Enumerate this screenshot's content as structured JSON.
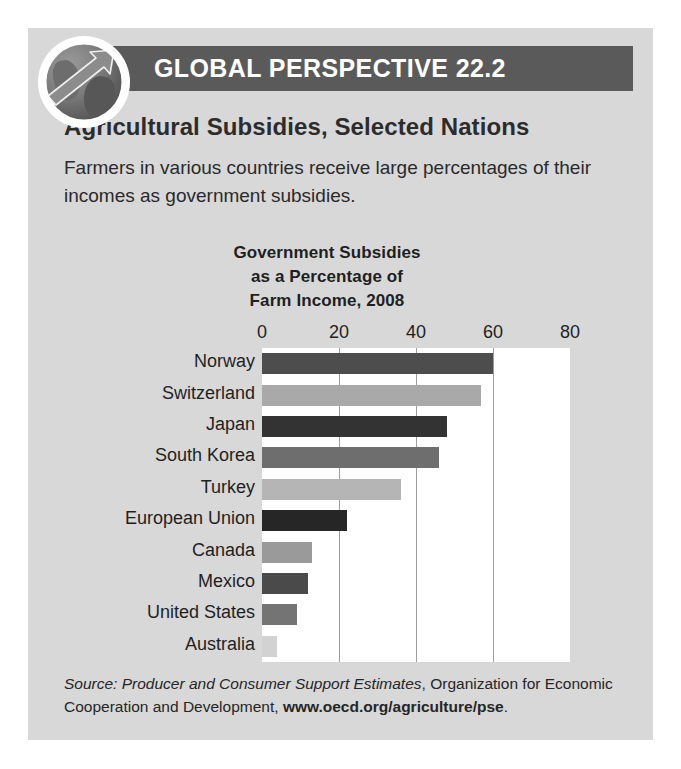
{
  "header": {
    "banner_label": "GLOBAL PERSPECTIVE 22.2",
    "globe_icon": "globe-arrow-icon",
    "banner_color": "#5a5a5a"
  },
  "box": {
    "background_color": "#d8d8d8"
  },
  "article": {
    "subject": "Agricultural Subsidies, Selected Nations",
    "lede": "Farmers in various countries receive large percentages of their incomes as government subsidies."
  },
  "source": {
    "label": "Source:",
    "italic_part": "Producer and Consumer Support Estimates",
    "rest": ", Organization for Economic Cooperation and Development, ",
    "url": "www.oecd.org/agriculture/pse",
    "period": "."
  },
  "chart_data": {
    "type": "bar",
    "orientation": "horizontal",
    "title_lines": [
      "Government Subsidies",
      "as a Percentage of",
      "Farm Income, 2008"
    ],
    "xlabel": "",
    "ylabel": "",
    "xlim": [
      0,
      80
    ],
    "xticks": [
      0,
      20,
      40,
      60
    ],
    "xtick_labels": [
      "0",
      "20",
      "40",
      "60",
      "80"
    ],
    "xtick_values": [
      0,
      20,
      40,
      60,
      80
    ],
    "grid": true,
    "legend": "none",
    "categories": [
      "Norway",
      "Switzerland",
      "Japan",
      "South Korea",
      "Turkey",
      "European Union",
      "Canada",
      "Mexico",
      "United States",
      "Australia"
    ],
    "values": [
      60,
      57,
      48,
      46,
      36,
      22,
      13,
      12,
      9,
      4
    ],
    "bar_colors": [
      "#4d4d4d",
      "#a9a9a9",
      "#333333",
      "#6e6e6e",
      "#b5b5b5",
      "#262626",
      "#9a9a9a",
      "#4a4a4a",
      "#747474",
      "#d2d2d2"
    ]
  }
}
